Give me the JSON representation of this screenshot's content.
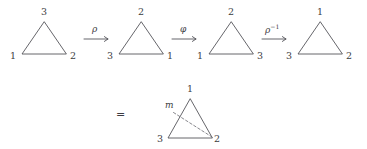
{
  "figure": {
    "type": "math-transformation-diagram",
    "background_color": "#ffffff",
    "stroke_color": "#55555a",
    "text_color": "#3c3c42"
  },
  "top_row": {
    "triangles": [
      {
        "id": "triangle-1",
        "apex_label": "3",
        "bottom_left_label": "1",
        "bottom_right_label": "2"
      },
      {
        "id": "triangle-2",
        "apex_label": "2",
        "bottom_left_label": "3",
        "bottom_right_label": "1"
      },
      {
        "id": "triangle-3",
        "apex_label": "2",
        "bottom_left_label": "1",
        "bottom_right_label": "3"
      },
      {
        "id": "triangle-4",
        "apex_label": "1",
        "bottom_left_label": "3",
        "bottom_right_label": "2"
      }
    ],
    "arrows": [
      {
        "id": "arrow-rho",
        "label": "ρ",
        "superscript": ""
      },
      {
        "id": "arrow-phi",
        "label": "φ",
        "superscript": ""
      },
      {
        "id": "arrow-rho-inverse",
        "label": "ρ",
        "superscript": "−1"
      }
    ]
  },
  "bottom_row": {
    "equals_sign": "=",
    "result_triangle": {
      "id": "triangle-result",
      "apex_label": "1",
      "bottom_left_label": "3",
      "bottom_right_label": "2",
      "mirror_label": "m"
    }
  }
}
